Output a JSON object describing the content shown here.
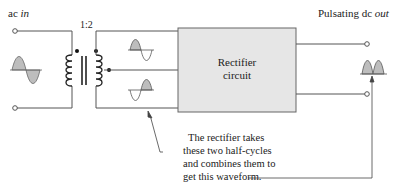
{
  "diagram": {
    "input_label_prefix": "ac ",
    "input_label_italic": "in",
    "ratio_label": "1:2",
    "block_label_line1": "Rectifier",
    "block_label_line2": "circuit",
    "output_label_prefix": "Pulsating dc ",
    "output_label_italic": "out",
    "annotation": [
      "The rectifier takes",
      "these two half-cycles",
      "and combines them to",
      "get this waveform."
    ],
    "colors": {
      "line": "#555555",
      "block_fill": "#e6e6e6",
      "block_stroke": "#666666",
      "wave_fill": "#bdbdbd",
      "text": "#222222"
    }
  }
}
